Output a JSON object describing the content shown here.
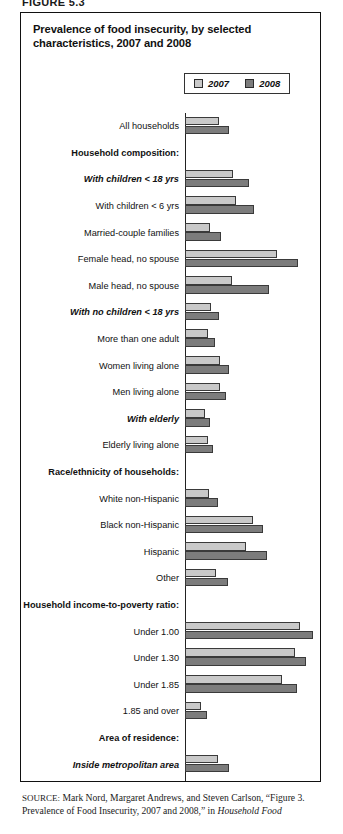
{
  "figure_number": "FIGURE 5.3",
  "title": "Prevalence of food insecurity, by selected characteristics, 2007 and 2008",
  "legend": {
    "items": [
      {
        "label": "2007",
        "color": "#c9c9c9"
      },
      {
        "label": "2008",
        "color": "#7c7c7c"
      }
    ]
  },
  "source": {
    "prefix": "SOURCE:",
    "text_1": " Mark Nord, Margaret Andrews, and Steven Carlson, “Figure 3. Prevalence of Food Insecurity, 2007 and 2008,” in ",
    "italic_1": "Household Food"
  },
  "chart_data": {
    "type": "bar",
    "orientation": "horizontal",
    "title": "Prevalence of food insecurity, by selected characteristics, 2007 and 2008",
    "xlabel": "Percent of households",
    "ylabel": "",
    "xlim": [
      0,
      45
    ],
    "xticks": [
      0,
      5,
      10,
      15,
      20,
      25,
      30,
      35,
      40,
      45
    ],
    "grid": false,
    "legend_position": "top-right",
    "series": [
      {
        "name": "2007",
        "color": "#c9c9c9"
      },
      {
        "name": "2008",
        "color": "#7c7c7c"
      }
    ],
    "rows": [
      {
        "label": "All households",
        "style": "normal",
        "values": [
          11.1,
          14.6
        ]
      },
      {
        "label": "Household composition:",
        "style": "header",
        "values": [
          null,
          null
        ]
      },
      {
        "label": "With children < 18 yrs",
        "style": "subheader",
        "values": [
          15.8,
          21.0
        ]
      },
      {
        "label": "With children < 6 yrs",
        "style": "normal",
        "values": [
          16.9,
          22.5
        ]
      },
      {
        "label": "Married-couple families",
        "style": "normal",
        "values": [
          8.2,
          11.9
        ]
      },
      {
        "label": "Female head, no spouse",
        "style": "normal",
        "values": [
          30.2,
          37.2
        ]
      },
      {
        "label": "Male head, no spouse",
        "style": "normal",
        "values": [
          15.4,
          27.6
        ]
      },
      {
        "label": "With no children < 18 yrs",
        "style": "subheader",
        "values": [
          8.6,
          11.3
        ]
      },
      {
        "label": "More than one adult",
        "style": "normal",
        "values": [
          7.4,
          9.9
        ]
      },
      {
        "label": "Women living alone",
        "style": "normal",
        "values": [
          11.4,
          14.5
        ]
      },
      {
        "label": "Men living alone",
        "style": "normal",
        "values": [
          11.6,
          13.6
        ]
      },
      {
        "label": "With elderly",
        "style": "subheader",
        "values": [
          6.5,
          8.1
        ]
      },
      {
        "label": "Elderly living alone",
        "style": "normal",
        "values": [
          7.5,
          9.2
        ]
      },
      {
        "label": "Race/ethnicity of households:",
        "style": "header",
        "values": [
          null,
          null
        ]
      },
      {
        "label": "White non-Hispanic",
        "style": "normal",
        "values": [
          7.9,
          10.7
        ]
      },
      {
        "label": "Black non-Hispanic",
        "style": "normal",
        "values": [
          22.2,
          25.7
        ]
      },
      {
        "label": "Hispanic",
        "style": "normal",
        "values": [
          20.1,
          26.9
        ]
      },
      {
        "label": "Other",
        "style": "normal",
        "values": [
          10.2,
          14.2
        ]
      },
      {
        "label": "Household income-to-poverty ratio:",
        "style": "header",
        "values": [
          null,
          null
        ]
      },
      {
        "label": "Under 1.00",
        "style": "normal",
        "values": [
          37.7,
          42.2
        ]
      },
      {
        "label": "Under 1.30",
        "style": "normal",
        "values": [
          36.1,
          39.8
        ]
      },
      {
        "label": "Under 1.85",
        "style": "normal",
        "values": [
          31.7,
          36.8
        ]
      },
      {
        "label": "1.85 and over",
        "style": "normal",
        "values": [
          5.2,
          7.1
        ]
      },
      {
        "label": "Area of residence:",
        "style": "header",
        "values": [
          null,
          null
        ]
      },
      {
        "label": "Inside metropolitan area",
        "style": "subheader",
        "values": [
          10.8,
          14.4
        ]
      },
      {
        "label": "In principal cities",
        "style": "normal",
        "values": [
          13.4,
          17.7
        ]
      },
      {
        "label": "Not in principal cities",
        "style": "normal",
        "values": [
          8.6,
          11.8
        ]
      },
      {
        "label": "Outside metropolitan area",
        "style": "subheader",
        "values": [
          12.0,
          15.5
        ]
      },
      {
        "label": "Census geographic region:",
        "style": "header",
        "values": [
          null,
          null
        ]
      },
      {
        "label": "Northeast",
        "style": "normal",
        "values": [
          9.6,
          12.4
        ]
      },
      {
        "label": "Midwest",
        "style": "normal",
        "values": [
          10.6,
          13.6
        ]
      },
      {
        "label": "South",
        "style": "normal",
        "values": [
          12.4,
          15.9
        ]
      },
      {
        "label": "West",
        "style": "normal",
        "values": [
          11.0,
          15.1
        ]
      }
    ]
  }
}
